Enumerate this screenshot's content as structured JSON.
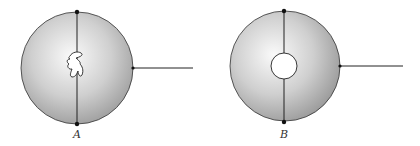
{
  "figure": {
    "colors": {
      "sphere_light": "#fafafa",
      "sphere_dark": "#9a9a9a",
      "stroke": "#222222",
      "background": "#ffffff"
    },
    "spheres": [
      {
        "id": "A",
        "label": "A",
        "center": [
          83,
          67
        ],
        "radius": 55,
        "axis_x": 77,
        "cavity": "irregular",
        "wire_end_x": 193
      },
      {
        "id": "B",
        "label": "B",
        "center": [
          285,
          66
        ],
        "radius": 54,
        "axis_x": 284,
        "cavity": "circular",
        "cavity_radius": 13,
        "wire_end_x": 403
      }
    ]
  }
}
